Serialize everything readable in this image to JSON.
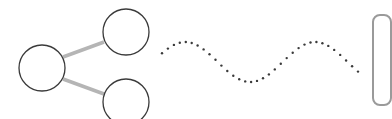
{
  "illustration": {
    "share_graph": {
      "icon": "share-network-icon",
      "stroke_color": "#3a3a3a",
      "link_color": "#b5b5b5",
      "nodes": [
        {
          "id": "left",
          "cx": 42,
          "cy": 68,
          "r": 23
        },
        {
          "id": "top-right",
          "cx": 126,
          "cy": 32,
          "r": 23
        },
        {
          "id": "bottom-right",
          "cx": 126,
          "cy": 102,
          "r": 23
        }
      ]
    },
    "dotted_wave": {
      "icon": "dotted-wave-icon",
      "dot_color": "#3a3a3a"
    },
    "edge_card": {
      "border_color": "#9a9a9a"
    }
  }
}
